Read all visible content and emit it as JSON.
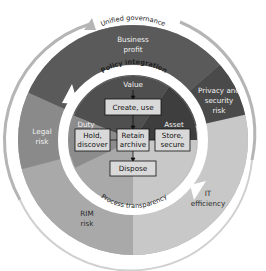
{
  "diagram": {
    "outer_arc_label": "Unified governance",
    "policy_arc_label": "Policy integration",
    "process_arc_label": "Process transparency",
    "outer_segments": [
      {
        "id": "business",
        "lines": [
          "Business",
          "profit"
        ],
        "color": "#5a5a5a"
      },
      {
        "id": "privacy",
        "lines": [
          "Privacy and",
          "security",
          "risk"
        ],
        "color": "#4a4a4a"
      },
      {
        "id": "it",
        "lines": [
          "IT",
          "efficiency"
        ],
        "color": "#c8c8c8"
      },
      {
        "id": "rim",
        "lines": [
          "RIM",
          "risk"
        ],
        "color": "#a9a9a9"
      },
      {
        "id": "legal",
        "lines": [
          "Legal",
          "risk"
        ],
        "color": "#8a8a8a"
      }
    ],
    "inner_segments": [
      {
        "id": "value",
        "label": "Value",
        "color": "#4f4f4f"
      },
      {
        "id": "asset",
        "label": "Asset",
        "color": "#3e3e3e"
      },
      {
        "id": "duty",
        "label": "Duty",
        "color": "#8c8c8c"
      }
    ],
    "boxes": {
      "create": "Create, use",
      "hold": [
        "Hold,",
        "discover"
      ],
      "retain": [
        "Retain",
        "archive"
      ],
      "store": [
        "Store,",
        "secure"
      ],
      "dispose": "Dispose"
    },
    "colors": {
      "box_fill": "#d9d9d9",
      "ring": "#ffffff",
      "outer_arc": "#b5b5b5"
    }
  }
}
